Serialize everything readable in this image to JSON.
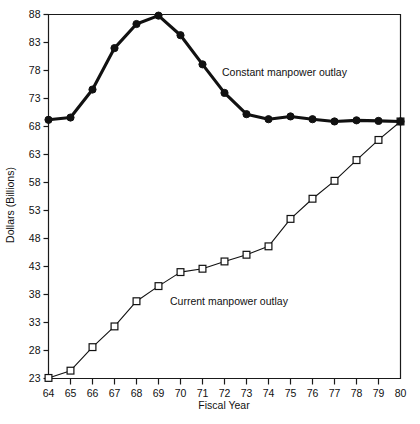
{
  "chart_data": {
    "type": "line",
    "title": "",
    "xlabel": "Fiscal Year",
    "ylabel": "Dollars (Billions)",
    "xlim": [
      64,
      80
    ],
    "ylim": [
      23,
      88
    ],
    "xticks": [
      "64",
      "65",
      "66",
      "67",
      "68",
      "69",
      "70",
      "71",
      "72",
      "73",
      "74",
      "75",
      "76",
      "77",
      "78",
      "79",
      "80"
    ],
    "yticks": [
      "23",
      "28",
      "33",
      "38",
      "43",
      "48",
      "53",
      "58",
      "63",
      "68",
      "73",
      "78",
      "83",
      "88"
    ],
    "grid": false,
    "legend_position": "inline-annotations",
    "x": [
      64,
      65,
      66,
      67,
      68,
      69,
      70,
      71,
      72,
      73,
      74,
      75,
      76,
      77,
      78,
      79,
      80
    ],
    "series": [
      {
        "name": "Constant manpower outlay",
        "marker": "filled-circle",
        "line_weight": "thick",
        "values": [
          69.2,
          69.6,
          74.6,
          82.0,
          86.3,
          87.8,
          84.3,
          79.1,
          74.0,
          70.2,
          69.3,
          69.8,
          69.3,
          68.9,
          69.1,
          69.0,
          68.9
        ]
      },
      {
        "name": "Current manpower outlay",
        "marker": "open-square",
        "line_weight": "thin",
        "values": [
          23.1,
          24.4,
          28.6,
          32.3,
          36.8,
          39.5,
          42.0,
          42.6,
          43.9,
          45.1,
          46.6,
          51.5,
          55.1,
          58.3,
          62.0,
          65.6,
          68.9
        ]
      }
    ],
    "annotations": [
      {
        "text": "Constant manpower outlay",
        "x_px": 222,
        "y_px": 76
      },
      {
        "text": "Current manpower outlay",
        "x_px": 170,
        "y_px": 305
      }
    ]
  },
  "axis": {
    "x_title": "Fiscal Year",
    "y_title": "Dollars (Billions)"
  }
}
